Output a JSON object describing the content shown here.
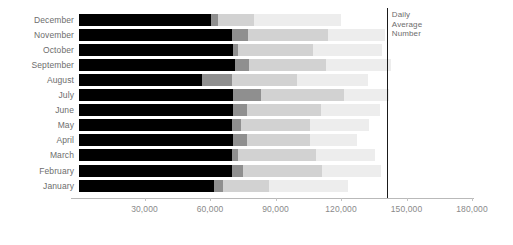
{
  "chart_data": {
    "type": "bar",
    "orientation": "horizontal",
    "stacked": true,
    "title": "",
    "xlabel": "",
    "ylabel": "",
    "xlim": [
      0,
      180000
    ],
    "xticks": [
      0,
      30000,
      60000,
      90000,
      120000,
      150000,
      180000
    ],
    "xtick_labels": [
      "",
      "30,000",
      "60,000",
      "90,000",
      "120,000",
      "150,000",
      "180,000"
    ],
    "grid": false,
    "legend": "none",
    "categories": [
      "December",
      "November",
      "October",
      "September",
      "August",
      "July",
      "June",
      "May",
      "April",
      "March",
      "February",
      "January"
    ],
    "series": [
      {
        "name": "Segment 1",
        "color": "#000000",
        "values": [
          60500,
          70000,
          70500,
          71500,
          56500,
          70500,
          70500,
          70000,
          70500,
          70000,
          70000,
          62000
        ]
      },
      {
        "name": "Segment 2",
        "color": "#8f8f8f",
        "values": [
          3000,
          7500,
          2500,
          6500,
          13500,
          13000,
          6500,
          4000,
          6500,
          3000,
          5000,
          4000
        ]
      },
      {
        "name": "Segment 3",
        "color": "#d2d2d2",
        "values": [
          16500,
          36500,
          34000,
          35000,
          30000,
          38000,
          34000,
          32000,
          29000,
          35500,
          36500,
          21000
        ]
      },
      {
        "name": "Segment 4",
        "color": "#ededed",
        "values": [
          40000,
          26000,
          32000,
          30000,
          32500,
          20500,
          27000,
          27000,
          21500,
          27000,
          27000,
          36000
        ]
      }
    ],
    "totals": [
      120000,
      140000,
      139000,
      143000,
      132500,
      142000,
      138000,
      133000,
      127500,
      135500,
      138500,
      123000
    ],
    "annotations": [
      {
        "name": "daily-average-number",
        "text": "Daily\nAverage\nNumber",
        "value": 141000,
        "type": "vertical-reference-line",
        "color": "#1a1a1a"
      }
    ]
  },
  "axis": {
    "tick_30k": "30,000",
    "tick_60k": "60,000",
    "tick_90k": "90,000",
    "tick_120k": "120,000",
    "tick_150k": "150,000",
    "tick_180k": "180,000"
  },
  "labels": {
    "december": "December",
    "november": "November",
    "october": "October",
    "september": "September",
    "august": "August",
    "july": "July",
    "june": "June",
    "may": "May",
    "april": "April",
    "march": "March",
    "february": "February",
    "january": "January"
  },
  "reference": {
    "note_line1": "Daily",
    "note_line2": "Average",
    "note_line3": "Number"
  }
}
